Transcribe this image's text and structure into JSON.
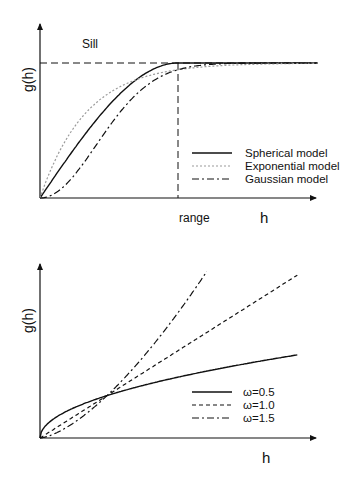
{
  "chart_data": [
    {
      "type": "line",
      "title": "",
      "xlabel": "h",
      "ylabel": "g(h)",
      "annotations": [
        {
          "text": "Sill",
          "meaning": "horizontal dashed line at sill value"
        },
        {
          "text": "range",
          "meaning": "vertical dashed line at range value"
        }
      ],
      "sill": 1.0,
      "range": 1.0,
      "xlim": [
        0,
        2.03
      ],
      "ylim": [
        0,
        1.3
      ],
      "ticks": false,
      "grid": false,
      "legend_position": "right-middle",
      "series": [
        {
          "name": "Spherical model",
          "style": "solid",
          "color": "#111111",
          "formula": "spherical"
        },
        {
          "name": "Exponential model",
          "style": "dotted",
          "color": "#9a9a9a",
          "formula": "exponential"
        },
        {
          "name": "Gaussian model",
          "style": "dash-dot",
          "color": "#111111",
          "formula": "gaussian"
        }
      ]
    },
    {
      "type": "line",
      "title": "",
      "xlabel": "h",
      "ylabel": "g(h)",
      "xlim": [
        0,
        4.2
      ],
      "ylim": [
        0,
        4.1
      ],
      "ticks": false,
      "grid": false,
      "legend_position": "right-middle",
      "series": [
        {
          "name": "ω=0.5",
          "exponent": 0.5,
          "style": "solid",
          "color": "#111111",
          "h_max": 3.84
        },
        {
          "name": "ω=1.0",
          "exponent": 1.0,
          "style": "dashed",
          "color": "#111111",
          "h_max": 3.84
        },
        {
          "name": "ω=1.5",
          "exponent": 1.5,
          "style": "dash-dot",
          "color": "#111111",
          "h_max": 2.49
        }
      ]
    }
  ]
}
